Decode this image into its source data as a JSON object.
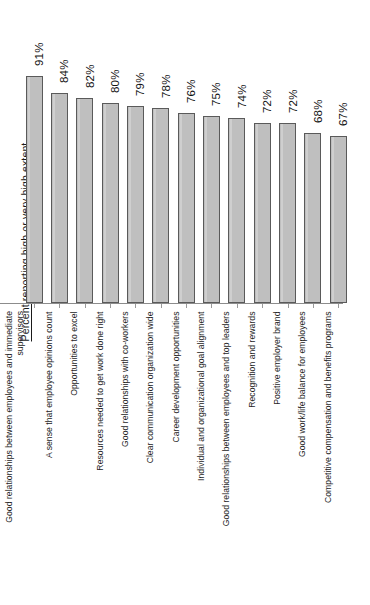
{
  "chart_data": {
    "type": "bar",
    "title": "",
    "subtitle": "",
    "xlabel": "",
    "ylabel": "Percent reporting high or very high extent",
    "ylim": [
      0,
      100
    ],
    "grid": false,
    "legend": null,
    "orientation": "vertical",
    "value_suffix": "%",
    "categories": [
      "Good relationships between employees and immediate\nsupervisors",
      "A sense that employee opinions count",
      "Opportunities to excel",
      "Resources needed to get work done right",
      "Good relationships with co-workers",
      "Clear communication organization wide",
      "Career development opportunities",
      "Individual and organizational goal alignment",
      "Good relationships between employees and  top leaders",
      "Recognition and rewards",
      "Positive employer brand",
      "Good work/life balance for employees",
      "Competitive compensation and benefits programs"
    ],
    "values": [
      91,
      84,
      82,
      80,
      79,
      78,
      76,
      75,
      74,
      72,
      72,
      68,
      67
    ],
    "value_labels": [
      "91%",
      "84%",
      "82%",
      "80%",
      "79%",
      "78%",
      "76%",
      "75%",
      "74%",
      "72%",
      "72%",
      "68%",
      "67%"
    ],
    "colors": {
      "bar_fill": "#bfbfbf",
      "bar_border": "#5a5a5a",
      "axis": "#8c8c8c",
      "text": "#1a1a1a",
      "background": "#ffffff"
    }
  }
}
